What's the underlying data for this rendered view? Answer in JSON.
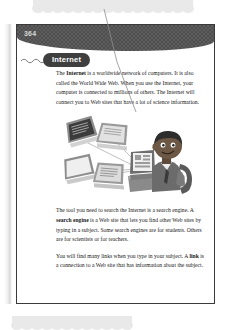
{
  "page": {
    "number": "364",
    "section_title": "Internet"
  },
  "content": {
    "paragraph_1_html": "The <b>Internet</b> is a worldwide network of computers. It is also called the World Wide Web. When you use the Internet, your computer is connected to millions of others. The Internet will connect you to Web sites that have a lot of science information.",
    "paragraph_2_html": "The tool you need to search the Internet is a search engine. A <b>search engine</b> is a Web site that lets you find other Web sites by typing in a subject. Some search engines are for students. Others are for scientists or for teachers.",
    "paragraph_3_html": "You will find many links when you type in your subject. A <b>link</b> is a connection to a Web site that has information about the subject."
  },
  "illustration": {
    "name": "networked-computers-and-student-illustration",
    "description": "Four computer monitors connected by lines to a student sitting at a desktop computer"
  },
  "colors": {
    "header_band": "#4e4e4e",
    "title_pill": "#3f3f3f",
    "page_border": "#3a3a3a",
    "cloud_decoration": "#e9e9e9",
    "text": "#161616",
    "leader_line": "#8d8d8d"
  }
}
